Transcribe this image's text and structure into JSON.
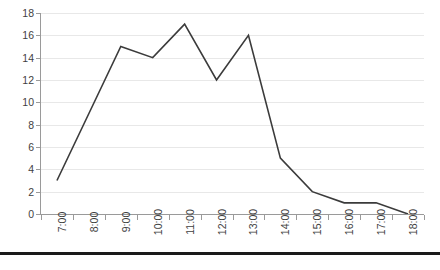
{
  "chart_data": {
    "type": "line",
    "title": "",
    "subtitle": "",
    "xlabel": "",
    "ylabel": "",
    "categories": [
      "7:00",
      "8:00",
      "9:00",
      "10:00",
      "11:00",
      "12:00",
      "13:00",
      "14:00",
      "15:00",
      "16:00",
      "17:00",
      "18:00"
    ],
    "series": [
      {
        "name": "",
        "values": [
          3,
          9,
          15,
          14,
          17,
          12,
          16,
          5,
          2,
          1,
          1,
          0
        ],
        "color": "#3b3b3b"
      }
    ],
    "ylim": [
      0,
      18
    ],
    "ytick_step": 2,
    "ytick_labels": [
      "0",
      "2",
      "4",
      "6",
      "8",
      "10",
      "12",
      "14",
      "16",
      "18"
    ],
    "grid": true,
    "grid_axis": "y",
    "grid_color": "#e8e8e8",
    "legend": false,
    "legend_position": "none",
    "markers": false,
    "line_width": 1.6,
    "plot_background": "#ffffff",
    "axis_color": "#9a9a9a",
    "label_color": "#3f3f3f",
    "xlabel_rotation": -90,
    "annotations": []
  },
  "figure": {
    "background": "#ffffff",
    "bottom_rule_color": "#1a1a1a"
  }
}
